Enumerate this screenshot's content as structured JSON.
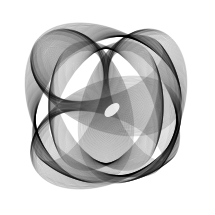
{
  "canvas": {
    "width": 215,
    "height": 215,
    "background": "#ffffff",
    "stroke": "#000000"
  },
  "artwork": {
    "kind": "generative-line-art",
    "description": "Dense overlapping ellipse sweeps forming a rotated square-like knot with a small white lens-shaped void near the center",
    "center": [
      106,
      106
    ],
    "bands": [
      {
        "cx": 0,
        "cy": -38,
        "rx0": 60,
        "ry0": 28,
        "rx1": 80,
        "ry1": 50,
        "rot0": -20,
        "rot1": 25,
        "count": 70,
        "opacity": 0.22
      },
      {
        "cx": 38,
        "cy": 0,
        "rx0": 28,
        "ry0": 60,
        "rx1": 50,
        "ry1": 80,
        "rot0": -25,
        "rot1": 20,
        "count": 70,
        "opacity": 0.22
      },
      {
        "cx": 0,
        "cy": 38,
        "rx0": 60,
        "ry0": 28,
        "rx1": 80,
        "ry1": 50,
        "rot0": 20,
        "rot1": -25,
        "count": 70,
        "opacity": 0.22
      },
      {
        "cx": -38,
        "cy": 0,
        "rx0": 28,
        "ry0": 60,
        "rx1": 50,
        "ry1": 80,
        "rot0": 25,
        "rot1": -20,
        "count": 70,
        "opacity": 0.22
      },
      {
        "cx": 0,
        "cy": 0,
        "rx0": 45,
        "ry0": 70,
        "rx1": 70,
        "ry1": 45,
        "rot0": 30,
        "rot1": 60,
        "count": 60,
        "opacity": 0.2
      }
    ],
    "void": {
      "cx": 6,
      "cy": 4,
      "rx": 9,
      "ry": 5,
      "rot": -40
    }
  }
}
